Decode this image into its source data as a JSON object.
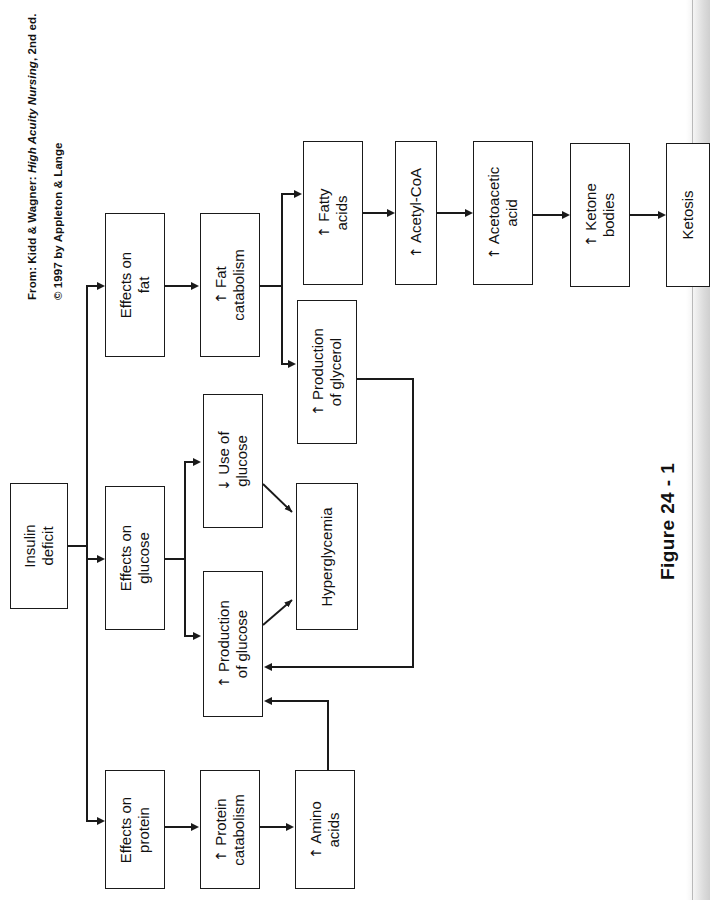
{
  "page": {
    "width": 710,
    "height": 900,
    "background": "#ffffff",
    "ink_color": "#1a1a1a"
  },
  "credits": {
    "source_prefix": "From: Kidd & Wagner: ",
    "source_title": "High Acuity Nursing",
    "source_suffix": ", 2nd ed.",
    "copyright": "© 1997 by Appleton & Lange"
  },
  "caption": {
    "text": "Figure 24 - 1"
  },
  "diagram": {
    "orientation": "rotated-90-ccw",
    "nodes": [
      {
        "id": "insulin-deficit",
        "lines": [
          "Insulin",
          "deficit"
        ],
        "arrow": ""
      },
      {
        "id": "effects-on-fat",
        "lines": [
          "Effects on",
          "fat"
        ],
        "arrow": ""
      },
      {
        "id": "fat-catabolism",
        "lines": [
          "Fat",
          "catabolism"
        ],
        "arrow": "↑"
      },
      {
        "id": "fatty-acids",
        "lines": [
          "Fatty",
          "acids"
        ],
        "arrow": "↑"
      },
      {
        "id": "acetyl-coa",
        "lines": [
          "Acetyl-CoA"
        ],
        "arrow": "↑"
      },
      {
        "id": "acetoacetic-acid",
        "lines": [
          "Acetoacetic",
          "acid"
        ],
        "arrow": "↑"
      },
      {
        "id": "ketone-bodies",
        "lines": [
          "Ketone",
          "bodies"
        ],
        "arrow": "↑"
      },
      {
        "id": "ketosis",
        "lines": [
          "Ketosis"
        ],
        "arrow": ""
      },
      {
        "id": "production-of-glycerol",
        "lines": [
          "Production",
          "of glycerol"
        ],
        "arrow": "↑"
      },
      {
        "id": "effects-on-glucose",
        "lines": [
          "Effects on",
          "glucose"
        ],
        "arrow": ""
      },
      {
        "id": "use-of-glucose",
        "lines": [
          "Use of",
          "glucose"
        ],
        "arrow": "↓"
      },
      {
        "id": "production-of-glucose",
        "lines": [
          "Production",
          "of glucose"
        ],
        "arrow": "↑"
      },
      {
        "id": "hyperglycemia",
        "lines": [
          "Hyperglycemia"
        ],
        "arrow": ""
      },
      {
        "id": "effects-on-protein",
        "lines": [
          "Effects on",
          "protein"
        ],
        "arrow": ""
      },
      {
        "id": "protein-catabolism",
        "lines": [
          "Protein",
          "catabolism"
        ],
        "arrow": "↑"
      },
      {
        "id": "amino-acids",
        "lines": [
          "Amino",
          "acids"
        ],
        "arrow": "↑"
      }
    ]
  }
}
